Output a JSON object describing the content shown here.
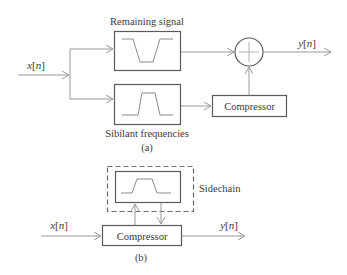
{
  "diagram_a": {
    "caption": "(a)",
    "input_label_var": "x",
    "input_label_idx": "n",
    "output_label_var": "y",
    "output_label_idx": "n",
    "top_filter_label": "Remaining signal",
    "top_filter_type": "band-stop",
    "bottom_filter_label": "Sibilant frequencies",
    "bottom_filter_type": "band-pass",
    "summer_symbol": "+",
    "compressor_label": "Compressor"
  },
  "diagram_b": {
    "caption": "(b)",
    "input_label_var": "x",
    "input_label_idx": "n",
    "output_label_var": "y",
    "output_label_idx": "n",
    "sidechain_label": "Sidechain",
    "sidechain_filter_type": "band-pass",
    "compressor_label": "Compressor"
  },
  "colors": {
    "line": "#8a8a8a",
    "box": "#5a5a5a",
    "text": "#3a3a3a",
    "background": "#ffffff"
  }
}
